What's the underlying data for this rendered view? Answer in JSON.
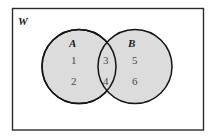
{
  "figure": {
    "type": "venn-diagram",
    "universe_label": "W",
    "background_color": "#ffffff",
    "border_color": "#2b2b2b",
    "circle_fill_color": "#dcdcdc",
    "circle_stroke_color": "#1a1a1a",
    "text_color": "#4a4a4a",
    "label_color": "#1b1b1b"
  },
  "sets": {
    "left": {
      "label": "A",
      "elements": [
        "1",
        "2"
      ]
    },
    "right": {
      "label": "B",
      "elements": [
        "5",
        "6"
      ]
    },
    "intersection": {
      "elements": [
        "3",
        "4"
      ]
    }
  },
  "elements": {
    "one": "1",
    "two": "2",
    "three": "3",
    "four": "4",
    "five": "5",
    "six": "6"
  }
}
